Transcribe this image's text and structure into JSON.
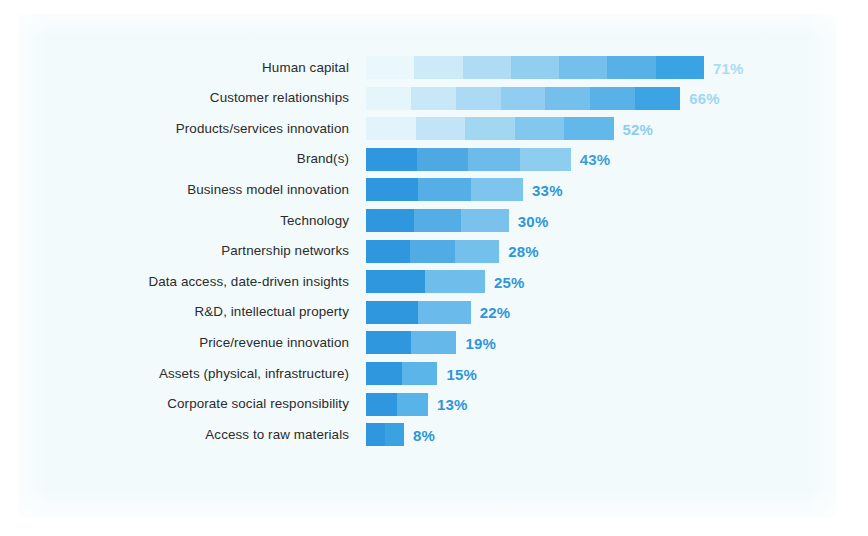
{
  "chart_data": {
    "type": "bar",
    "orientation": "horizontal",
    "title": "",
    "xlabel": "",
    "ylabel": "",
    "grid": false,
    "legend": null,
    "axis_visible": false,
    "tick_labels": [],
    "xlim": [
      0,
      71
    ],
    "value_suffix": "%",
    "categories": [
      "Human capital",
      "Customer relationships",
      "Products/services innovation",
      "Brand(s)",
      "Business model innovation",
      "Technology",
      "Partnership networks",
      "Data access, date-driven insights",
      "R&D, intellectual property",
      "Price/revenue innovation",
      "Assets (physical, infrastructure)",
      "Corporate social responsibility",
      "Access to raw materials"
    ],
    "values": [
      71,
      66,
      52,
      43,
      33,
      30,
      28,
      25,
      22,
      19,
      15,
      13,
      8
    ],
    "value_labels": [
      "71%",
      "66%",
      "52%",
      "43%",
      "33%",
      "30%",
      "28%",
      "25%",
      "22%",
      "19%",
      "15%",
      "13%",
      "8%"
    ],
    "bars": [
      {
        "category": "Human capital",
        "value": 71,
        "label": "71%",
        "fill_start": "#eaf8fd",
        "fill_end": "#3aa3e3",
        "label_color": "#a9dcf3"
      },
      {
        "category": "Customer relationships",
        "value": 66,
        "label": "66%",
        "fill_start": "#e4f5fc",
        "fill_end": "#3ca4e3",
        "label_color": "#9ed7f1"
      },
      {
        "category": "Products/services innovation",
        "value": 52,
        "label": "52%",
        "fill_start": "#e1f4fb",
        "fill_end": "#62b9e9",
        "label_color": "#8ecdee"
      },
      {
        "category": "Brand(s)",
        "value": 43,
        "label": "43%",
        "fill_start": "#2e97dd",
        "fill_end": "#8dcdf0",
        "label_color": "#3b9ed8"
      },
      {
        "category": "Business model innovation",
        "value": 33,
        "label": "33%",
        "fill_start": "#2e97dd",
        "fill_end": "#7ec5ee",
        "label_color": "#2f96d8"
      },
      {
        "category": "Technology",
        "value": 30,
        "label": "30%",
        "fill_start": "#2e97dd",
        "fill_end": "#79c2ed",
        "label_color": "#2f96d8"
      },
      {
        "category": "Partnership networks",
        "value": 28,
        "label": "28%",
        "fill_start": "#2e97dd",
        "fill_end": "#74c0ec",
        "label_color": "#2f96d8"
      },
      {
        "category": "Data access, date-driven insights",
        "value": 25,
        "label": "25%",
        "fill_start": "#2e97dd",
        "fill_end": "#6fbdeb",
        "label_color": "#2f96d8"
      },
      {
        "category": "R&D, intellectual property",
        "value": 22,
        "label": "22%",
        "fill_start": "#2e97dd",
        "fill_end": "#6abbeb",
        "label_color": "#2f96d8"
      },
      {
        "category": "Price/revenue innovation",
        "value": 19,
        "label": "19%",
        "fill_start": "#2e97dd",
        "fill_end": "#65b9ea",
        "label_color": "#2f96d8"
      },
      {
        "category": "Assets (physical, infrastructure)",
        "value": 15,
        "label": "15%",
        "fill_start": "#2e97dd",
        "fill_end": "#5cb5e9",
        "label_color": "#2f96d8"
      },
      {
        "category": "Corporate social responsibility",
        "value": 13,
        "label": "13%",
        "fill_start": "#2e97dd",
        "fill_end": "#57b3e8",
        "label_color": "#2f96d8"
      },
      {
        "category": "Access to raw materials",
        "value": 8,
        "label": "8%",
        "fill_start": "#2e97dd",
        "fill_end": "#3ba2e1",
        "label_color": "#2f96d8"
      }
    ],
    "colors": {
      "panel_background": "#f2fafc",
      "page_background": "#ffffff",
      "category_text": "#2b2b2b",
      "accent_blue": "#2e97dd",
      "lightest_blue": "#eaf8fd"
    },
    "geometry": {
      "bar_origin_x": 366,
      "px_per_percent": 4.76,
      "bar_height": 23,
      "row_pitch": 30.6,
      "first_row_top": 56
    }
  }
}
